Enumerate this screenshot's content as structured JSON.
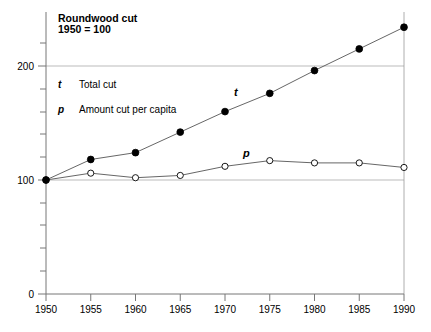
{
  "chart_data": {
    "type": "line",
    "title": "Roundwood cut",
    "subtitle": "1950 = 100",
    "xlabel": "",
    "ylabel": "",
    "x": [
      1950,
      1955,
      1960,
      1965,
      1970,
      1975,
      1980,
      1985,
      1990
    ],
    "categories": [
      "1950",
      "1955",
      "1960",
      "1965",
      "1970",
      "1975",
      "1980",
      "1985",
      "1990"
    ],
    "xlim": [
      1950,
      1990
    ],
    "ylim": [
      0,
      250
    ],
    "y_ticks_labeled": [
      0,
      100,
      200
    ],
    "y_tick_labels": [
      "0",
      "100",
      "200"
    ],
    "y_minor_tick_step": 20,
    "grid": "horizontal gridlines at 100 and 200",
    "legend_position": "inside top-left",
    "series": [
      {
        "name": "t",
        "label": "Total cut",
        "marker": "filled-circle",
        "inline_label": "t",
        "values": [
          100,
          118,
          124,
          142,
          160,
          176,
          196,
          215,
          234
        ]
      },
      {
        "name": "p",
        "label": "Amount cut per capita",
        "marker": "open-circle",
        "inline_label": "p",
        "values": [
          100,
          106,
          102,
          104,
          112,
          117,
          115,
          115,
          111
        ]
      }
    ]
  },
  "legend": {
    "entries": [
      {
        "key": "t",
        "text": "Total cut"
      },
      {
        "key": "p",
        "text": "Amount cut per capita"
      }
    ]
  },
  "colors": {
    "line": "#555555",
    "axis": "#777777",
    "grid": "#aaaaaa",
    "marker_fill": "#000000",
    "background": "#ffffff"
  }
}
